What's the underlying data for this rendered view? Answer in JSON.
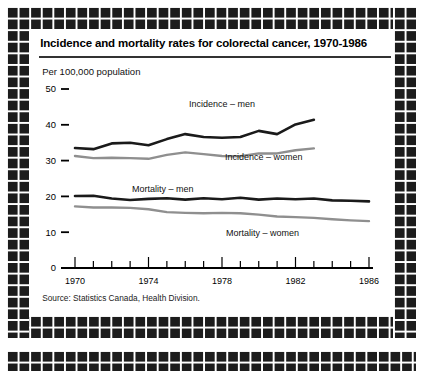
{
  "figure": {
    "title": "Incidence and mortality rates for colorectal cancer, 1970-1986",
    "unit_note": "Per 100,000 population",
    "source": "Source: Statistics Canada, Health Division."
  },
  "labels": {
    "incidence_men": "Incidence – men",
    "incidence_women": "Incidence – women",
    "mortality_men": "Mortality – men",
    "mortality_women": "Mortality – women"
  },
  "chart_data": {
    "type": "line",
    "title": "Incidence and mortality rates for colorectal cancer, 1970-1986",
    "subtitle": "Per 100,000 population",
    "xlabel": "",
    "ylabel": "Per 100,000 population",
    "xlim": [
      1970,
      1986
    ],
    "ylim": [
      0,
      50
    ],
    "ytick_values": [
      0,
      10,
      20,
      30,
      40,
      50
    ],
    "ytick_labels": [
      "0",
      "10",
      "20",
      "30",
      "40",
      "50"
    ],
    "xtick_values": [
      1970,
      1974,
      1978,
      1982,
      1986
    ],
    "xtick_labels": [
      "1970",
      "1974",
      "1978",
      "1982",
      "1986"
    ],
    "x_minor_ticks_every": 1,
    "grid": false,
    "legend": "inline-annotations",
    "colors": {
      "men": "#1a1a1a",
      "women": "#8f8f8f"
    },
    "series": [
      {
        "name": "Incidence – men",
        "color": "#1a1a1a",
        "x": [
          1970,
          1971,
          1972,
          1973,
          1974,
          1975,
          1976,
          1977,
          1978,
          1979,
          1980,
          1981,
          1982,
          1983
        ],
        "values": [
          33.5,
          33.2,
          34.8,
          35.0,
          34.3,
          36.0,
          37.4,
          36.6,
          36.4,
          36.6,
          38.3,
          37.4,
          40.1,
          41.4
        ]
      },
      {
        "name": "Incidence – women",
        "color": "#8f8f8f",
        "x": [
          1970,
          1971,
          1972,
          1973,
          1974,
          1975,
          1976,
          1977,
          1978,
          1979,
          1980,
          1981,
          1982,
          1983
        ],
        "values": [
          31.3,
          30.7,
          30.8,
          30.7,
          30.5,
          31.6,
          32.3,
          31.8,
          31.3,
          31.2,
          32.0,
          32.0,
          32.9,
          33.4
        ]
      },
      {
        "name": "Mortality – men",
        "color": "#1a1a1a",
        "x": [
          1970,
          1971,
          1972,
          1973,
          1974,
          1975,
          1976,
          1977,
          1978,
          1979,
          1980,
          1981,
          1982,
          1983,
          1984,
          1985,
          1986
        ],
        "values": [
          20.1,
          20.2,
          19.4,
          19.0,
          19.3,
          19.5,
          19.1,
          19.5,
          19.2,
          19.6,
          19.1,
          19.4,
          19.2,
          19.4,
          18.9,
          18.8,
          18.6
        ]
      },
      {
        "name": "Mortality – women",
        "color": "#8f8f8f",
        "x": [
          1970,
          1971,
          1972,
          1973,
          1974,
          1975,
          1976,
          1977,
          1978,
          1979,
          1980,
          1981,
          1982,
          1983,
          1984,
          1985,
          1986
        ],
        "values": [
          17.2,
          16.9,
          16.9,
          16.8,
          16.4,
          15.6,
          15.4,
          15.3,
          15.4,
          15.3,
          14.9,
          14.4,
          14.2,
          14.0,
          13.6,
          13.3,
          13.1
        ]
      }
    ]
  }
}
